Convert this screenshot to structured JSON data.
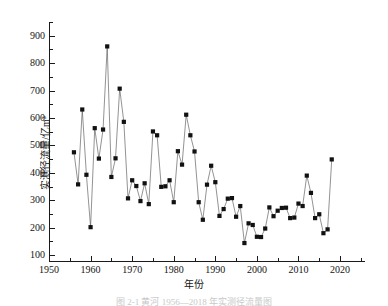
{
  "chart_data": {
    "type": "line",
    "title": "",
    "xlabel": "年份",
    "ylabel": "实测径流量/亿m³",
    "xlim": [
      1950,
      2026
    ],
    "ylim": [
      75,
      950
    ],
    "grid": false,
    "legend": null,
    "marker": "filled-square",
    "marker_color": "#111111",
    "line_color": "#4a4a4a",
    "x_ticks": [
      1950,
      1960,
      1970,
      1980,
      1990,
      2000,
      2010,
      2020
    ],
    "x_tick_labels": [
      "1950",
      "1960",
      "1970",
      "1980",
      "1990",
      "2000",
      "2010",
      "2020"
    ],
    "x_minor_ticks": [
      1955,
      1965,
      1975,
      1985,
      1995,
      2005,
      2015,
      2025
    ],
    "y_ticks": [
      100,
      200,
      300,
      400,
      500,
      600,
      700,
      800,
      900
    ],
    "y_tick_labels": [
      "100",
      "200",
      "300",
      "400",
      "500",
      "600",
      "700",
      "800",
      "900"
    ],
    "y_minor_ticks": [
      150,
      250,
      350,
      450,
      550,
      650,
      750,
      850,
      950
    ],
    "x": [
      1956,
      1957,
      1958,
      1959,
      1960,
      1961,
      1962,
      1963,
      1964,
      1965,
      1966,
      1967,
      1968,
      1969,
      1970,
      1971,
      1972,
      1973,
      1974,
      1975,
      1976,
      1977,
      1978,
      1979,
      1980,
      1981,
      1982,
      1983,
      1984,
      1985,
      1986,
      1987,
      1988,
      1989,
      1990,
      1991,
      1992,
      1993,
      1994,
      1995,
      1996,
      1997,
      1998,
      1999,
      2000,
      2001,
      2002,
      2003,
      2004,
      2005,
      2006,
      2007,
      2008,
      2009,
      2010,
      2011,
      2012,
      2013,
      2014,
      2015,
      2016,
      2017,
      2018
    ],
    "values": [
      475,
      358,
      631,
      393,
      202,
      563,
      452,
      558,
      861,
      385,
      453,
      707,
      586,
      307,
      373,
      352,
      297,
      362,
      286,
      551,
      537,
      349,
      351,
      373,
      293,
      479,
      430,
      612,
      537,
      478,
      293,
      229,
      357,
      426,
      366,
      243,
      268,
      306,
      308,
      240,
      279,
      144,
      216,
      210,
      167,
      166,
      197,
      274,
      242,
      262,
      272,
      273,
      235,
      237,
      288,
      279,
      390,
      327,
      235,
      249,
      180,
      194,
      449
    ]
  },
  "caption": {
    "text": "图 2-1  黄河 1956—2018 年实测径流量图"
  }
}
